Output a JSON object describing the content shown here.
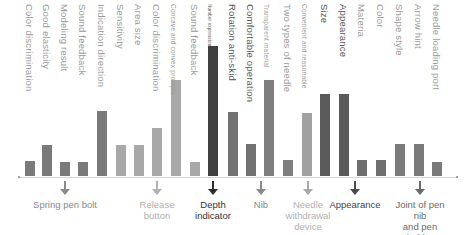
{
  "chart_data": {
    "type": "bar",
    "title": "",
    "xlabel": "",
    "ylabel": "",
    "ylim": [
      0,
      100
    ],
    "grid": false,
    "legend": null,
    "categories": [
      "Color discrimination",
      "Good elasticity",
      "Modeling result",
      "Sound feedback",
      "Indication direction",
      "Sensitivity",
      "Area size",
      "Color discrimination",
      "Concave and convex prompts",
      "Sound feedback",
      "Number expression",
      "Rotation anti-skid",
      "Comfortable operation",
      "Transparent material",
      "Two types of needle",
      "Convenient and reasonable",
      "Size",
      "Appearance",
      "Materia",
      "Color",
      "Shape style",
      "Arrow hint",
      "Needle loading port"
    ],
    "values": [
      11,
      24,
      10,
      10,
      50,
      24,
      24,
      37,
      73,
      10,
      100,
      49,
      25,
      74,
      12,
      49,
      63,
      63,
      12,
      12,
      24,
      24,
      10
    ],
    "groups": [
      {
        "name": "Spring pen bolt",
        "bars": [
          0,
          1,
          2,
          3,
          4
        ]
      },
      {
        "name": "Release button",
        "bars": [
          5,
          6,
          7,
          8,
          9
        ]
      },
      {
        "name": "Depth indicator",
        "bars": [
          10
        ]
      },
      {
        "name": "Nib",
        "bars": [
          11,
          12
        ]
      },
      {
        "name": "Needle withdrawal device",
        "bars": [
          13,
          14,
          15
        ]
      },
      {
        "name": "Appearance",
        "bars": [
          16,
          17
        ]
      },
      {
        "name": "Joint of pen nib and pen holder",
        "bars": [
          18,
          19,
          20,
          21,
          22
        ]
      }
    ]
  },
  "bars": [
    {
      "label": "Color discrimination",
      "x": 25,
      "top": 161,
      "color": "#7a7a7a",
      "label_class": ""
    },
    {
      "label": "Good elasticity",
      "x": 42,
      "top": 145,
      "color": "#7a7a7a",
      "label_class": ""
    },
    {
      "label": "Modeling result",
      "x": 60,
      "top": 162,
      "color": "#7a7a7a",
      "label_class": ""
    },
    {
      "label": "Sound feedback",
      "x": 78,
      "top": 162,
      "color": "#7a7a7a",
      "label_class": ""
    },
    {
      "label": "Indication direction",
      "x": 97,
      "top": 111,
      "color": "#7a7a7a",
      "label_class": ""
    },
    {
      "label": "Sensitivity",
      "x": 116,
      "top": 145,
      "color": "#a8a8a8",
      "label_class": ""
    },
    {
      "label": "Area size",
      "x": 134,
      "top": 145,
      "color": "#a8a8a8",
      "label_class": ""
    },
    {
      "label": "Color discrimination",
      "x": 152,
      "top": 128,
      "color": "#a8a8a8",
      "label_class": ""
    },
    {
      "label": "Concave and convex prompts",
      "x": 171,
      "top": 80,
      "color": "#a8a8a8",
      "label_class": "small"
    },
    {
      "label": "Sound feedback",
      "x": 190,
      "top": 162,
      "color": "#a8a8a8",
      "label_class": ""
    },
    {
      "label": "Number expression",
      "x": 208,
      "top": 46,
      "color": "#404040",
      "label_class": "tiny dark"
    },
    {
      "label": "Rotation anti-skid",
      "x": 228,
      "top": 112,
      "color": "#727272",
      "label_class": "dark"
    },
    {
      "label": "Comfortable operation",
      "x": 246,
      "top": 144,
      "color": "#727272",
      "label_class": "dark"
    },
    {
      "label": "Transparent material",
      "x": 264,
      "top": 80,
      "color": "#7e7e7e",
      "label_class": "small"
    },
    {
      "label": "Two types of needle",
      "x": 283,
      "top": 160,
      "color": "#7e7e7e",
      "label_class": ""
    },
    {
      "label": "Convenient and reasonable",
      "x": 302,
      "top": 113,
      "color": "#a0a0a0",
      "label_class": "small"
    },
    {
      "label": "Size",
      "x": 320,
      "top": 94,
      "color": "#5a5a5a",
      "label_class": "dark"
    },
    {
      "label": "Appearance",
      "x": 339,
      "top": 94,
      "color": "#5a5a5a",
      "label_class": "dark"
    },
    {
      "label": "Materia",
      "x": 357,
      "top": 160,
      "color": "#6e6e6e",
      "label_class": ""
    },
    {
      "label": "Color",
      "x": 376,
      "top": 160,
      "color": "#6e6e6e",
      "label_class": ""
    },
    {
      "label": "Shape style",
      "x": 395,
      "top": 144,
      "color": "#7a7a7a",
      "label_class": ""
    },
    {
      "label": "Arrow hint",
      "x": 414,
      "top": 144,
      "color": "#7a7a7a",
      "label_class": ""
    },
    {
      "label": "Needle loading port",
      "x": 432,
      "top": 162,
      "color": "#7a7a7a",
      "label_class": ""
    }
  ],
  "callouts": [
    {
      "label": "Spring pen bolt",
      "x": 65,
      "color": "#8a8a8a",
      "text_color": "#8a8a8a"
    },
    {
      "label": "Release\nbutton",
      "x": 157,
      "color": "#b0b0b0",
      "text_color": "#b0b0b0"
    },
    {
      "label": "Depth\nindicator",
      "x": 213,
      "color": "#2e2e2e",
      "text_color": "#333333"
    },
    {
      "label": "Nib",
      "x": 261,
      "color": "#8a8a8a",
      "text_color": "#8a8a8a"
    },
    {
      "label": "Needle\nwithdrawal\ndevice",
      "x": 308,
      "color": "#a8a8a8",
      "text_color": "#b0b0b0"
    },
    {
      "label": "Appearance",
      "x": 355,
      "color": "#4a4a4a",
      "text_color": "#444444"
    },
    {
      "label": "Joint of pen nib\nand pen holder",
      "x": 420,
      "color": "#6a6a6a",
      "text_color": "#6a6a6a"
    }
  ]
}
